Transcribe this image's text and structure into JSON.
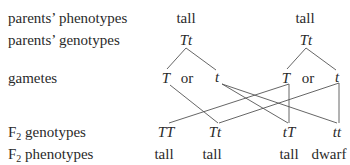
{
  "diagram": {
    "type": "genetic-cross",
    "row_labels": {
      "parents_phenotypes": "parents’ phenotypes",
      "parents_genotypes": "parents’ genotypes",
      "gametes": "gametes",
      "f2_genotypes_prefix": "F",
      "f2_genotypes_sub": "2",
      "f2_genotypes_rest": " genotypes",
      "f2_phenotypes_prefix": "F",
      "f2_phenotypes_sub": "2",
      "f2_phenotypes_rest": " phenotypes"
    },
    "parents": [
      {
        "phenotype": "tall",
        "genotype": "Tt",
        "gametes": [
          "T",
          "or",
          "t"
        ]
      },
      {
        "phenotype": "tall",
        "genotype": "Tt",
        "gametes": [
          "T",
          "or",
          "t"
        ]
      }
    ],
    "offspring": [
      {
        "genotype": "TT",
        "phenotype": "tall"
      },
      {
        "genotype": "Tt",
        "phenotype": "tall"
      },
      {
        "genotype": "tT",
        "phenotype": "tall"
      },
      {
        "genotype": "tt",
        "phenotype": "dwarf"
      }
    ],
    "line_color": "#555555"
  }
}
